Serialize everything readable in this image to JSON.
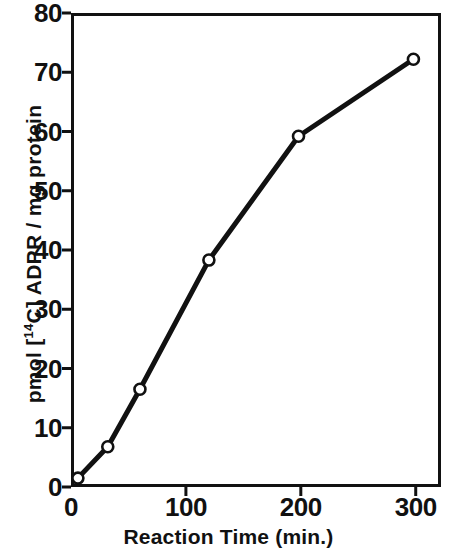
{
  "chart_data": {
    "type": "line",
    "title": "",
    "xlabel": "Reaction Time (min.)",
    "ylabel": "pmol [¹⁴C] ADPR / mg protein",
    "ylabel_parts": {
      "prefix": "pmol [",
      "isotope": "14",
      "suffix": "C] ADPR / mg  protein"
    },
    "xlim": [
      0,
      322
    ],
    "ylim": [
      0,
      80
    ],
    "xticks": [
      0,
      100,
      200,
      300
    ],
    "xtick_labels": [
      "0",
      "100",
      "200",
      "300"
    ],
    "yticks": [
      0,
      10,
      20,
      30,
      40,
      50,
      60,
      70,
      80
    ],
    "ytick_labels": [
      "0",
      "10",
      "20",
      "30",
      "40",
      "50",
      "60",
      "70",
      "80"
    ],
    "grid": false,
    "legend": false,
    "marker": "open-circle",
    "line_color": "#111111",
    "marker_face_color": "#ffffff",
    "marker_edge_color": "#111111",
    "series": [
      {
        "name": "ADP-ribosylation time course",
        "x": [
          6,
          32,
          60,
          120,
          198,
          298
        ],
        "y": [
          1.5,
          6.8,
          16.5,
          38.3,
          59.2,
          72.2
        ]
      }
    ]
  }
}
